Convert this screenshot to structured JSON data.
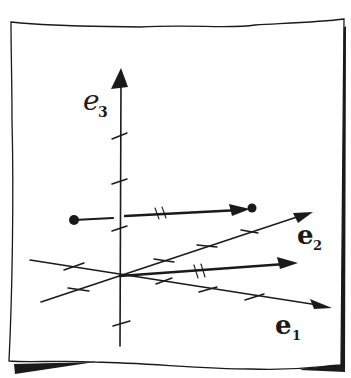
{
  "figure": {
    "colors": {
      "ink": "#1a1a1a",
      "paper": "#ffffff",
      "shadow": "#1a1a1a"
    },
    "axes": [
      {
        "name": "e1",
        "base": "e",
        "subscript": "1",
        "direction": "right-down"
      },
      {
        "name": "e2",
        "base": "e",
        "subscript": "2",
        "direction": "right-up"
      },
      {
        "name": "e3",
        "base": "e",
        "subscript": "3",
        "direction": "up"
      }
    ],
    "labels": {
      "e1_base": "e",
      "e1_sub": "1",
      "e2_base": "e",
      "e2_sub": "2",
      "e3_base": "e",
      "e3_sub": "3"
    },
    "vectors": [
      {
        "name": "position-vector",
        "from": "origin",
        "tick_marks": 2
      },
      {
        "name": "translated-vector",
        "from": "dot",
        "to": "dot",
        "tick_marks": 2
      }
    ]
  }
}
